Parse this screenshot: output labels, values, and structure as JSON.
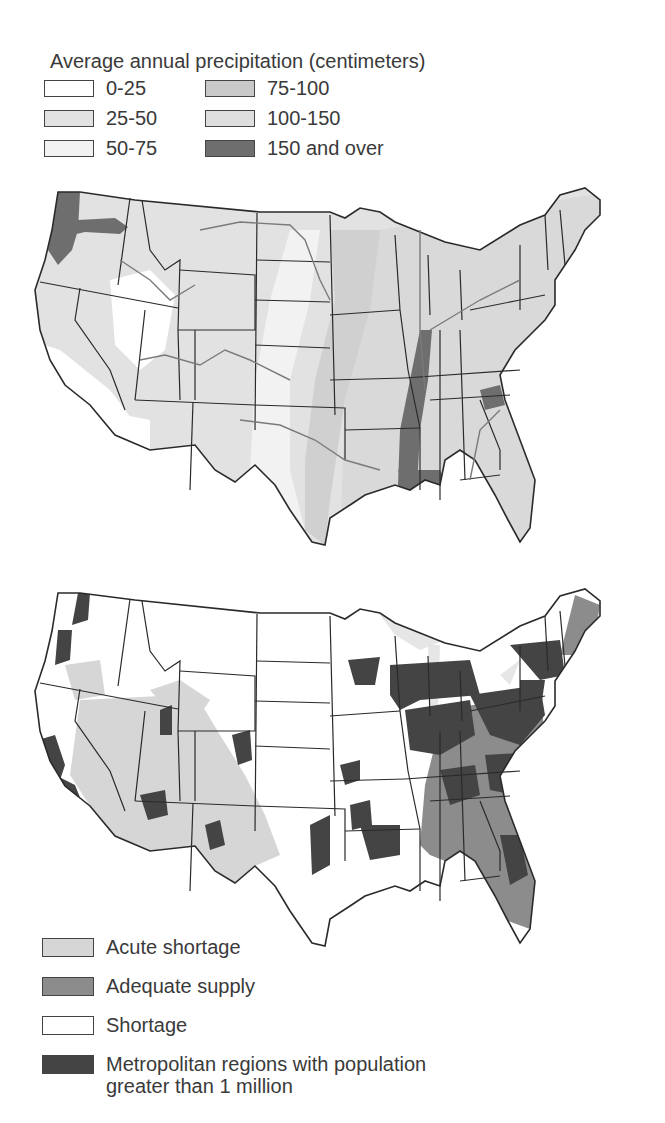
{
  "precipitation_map": {
    "title": "Average annual precipitation (centimeters)",
    "legend": [
      {
        "label": "0-25",
        "color": "#ffffff"
      },
      {
        "label": "25-50",
        "color": "#e2e2e2"
      },
      {
        "label": "50-75",
        "color": "#f2f2f2"
      },
      {
        "label": "75-100",
        "color": "#c9c9c9"
      },
      {
        "label": "100-150",
        "color": "#dedede"
      },
      {
        "label": "150 and over",
        "color": "#6e6e6e"
      }
    ]
  },
  "water_supply_map": {
    "legend": [
      {
        "label": "Acute shortage",
        "color": "#d6d6d6"
      },
      {
        "label": "Adequate supply",
        "color": "#8c8c8c"
      },
      {
        "label": "Shortage",
        "color": "#ffffff"
      },
      {
        "label": "Metropolitan regions with population",
        "label2": "greater than 1 million",
        "color": "#444444"
      }
    ]
  },
  "colors": {
    "outline": "#2a2a2a",
    "river": "#7a7a7a"
  }
}
